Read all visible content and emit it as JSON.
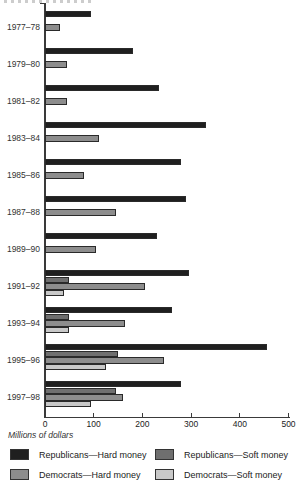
{
  "chart_data": {
    "type": "bar",
    "orientation": "horizontal",
    "title": "",
    "xlabel": "Millions of dollars",
    "categories": [
      "1977–78",
      "1979–80",
      "1981–82",
      "1983–84",
      "1985–86",
      "1987–88",
      "1989–90",
      "1991–92",
      "1993–94",
      "1995–96",
      "1997–98"
    ],
    "series": [
      {
        "name": "Republicans—Hard money",
        "color": "#1f1f1f",
        "values": [
          95,
          180,
          235,
          330,
          280,
          290,
          230,
          295,
          260,
          455,
          280
        ]
      },
      {
        "name": "Republicans—Soft money",
        "color": "#6f6f6f",
        "values": [
          null,
          null,
          null,
          null,
          null,
          null,
          null,
          50,
          50,
          150,
          145
        ]
      },
      {
        "name": "Democrats—Hard money",
        "color": "#8d8d8d",
        "values": [
          30,
          45,
          45,
          110,
          80,
          145,
          105,
          205,
          165,
          245,
          160
        ]
      },
      {
        "name": "Democrats—Soft money",
        "color": "#c8c8c8",
        "values": [
          null,
          null,
          null,
          null,
          null,
          null,
          null,
          40,
          50,
          125,
          95
        ]
      }
    ],
    "xlim": [
      0,
      500
    ],
    "xticks": [
      0,
      100,
      200,
      300,
      400,
      500
    ],
    "grid": false,
    "legend_position": "bottom",
    "legend_columns": [
      [
        "Republicans—Hard money",
        "Democrats—Hard money"
      ],
      [
        "Republicans—Soft money",
        "Democrats—Soft money"
      ]
    ]
  }
}
